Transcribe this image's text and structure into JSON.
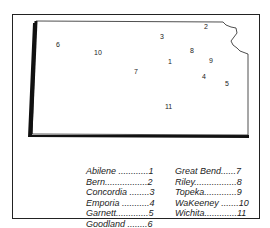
{
  "map_labels": [
    {
      "num": "1",
      "x": 168,
      "y": 58
    },
    {
      "num": "2",
      "x": 204,
      "y": 23
    },
    {
      "num": "3",
      "x": 160,
      "y": 33
    },
    {
      "num": "4",
      "x": 202,
      "y": 73
    },
    {
      "num": "5",
      "x": 225,
      "y": 80
    },
    {
      "num": "6",
      "x": 56,
      "y": 41
    },
    {
      "num": "7",
      "x": 134,
      "y": 68
    },
    {
      "num": "8",
      "x": 190,
      "y": 47
    },
    {
      "num": "9",
      "x": 209,
      "y": 57
    },
    {
      "num": "10",
      "x": 94,
      "y": 49
    },
    {
      "num": "11",
      "x": 165,
      "y": 103
    }
  ],
  "legend": {
    "left": [
      {
        "text": "Abilene ............1"
      },
      {
        "text": "Bern.................2"
      },
      {
        "text": "Concordia ........3"
      },
      {
        "text": "Emporia ...........4"
      },
      {
        "text": "Garnett.............5"
      },
      {
        "text": "Goodland ........6"
      }
    ],
    "right": [
      {
        "text": "Great Bend......7"
      },
      {
        "text": "Riley.................8"
      },
      {
        "text": "Topeka.............9"
      },
      {
        "text": "WaKeeney .......10"
      },
      {
        "text": "Wichita.............11"
      }
    ]
  }
}
